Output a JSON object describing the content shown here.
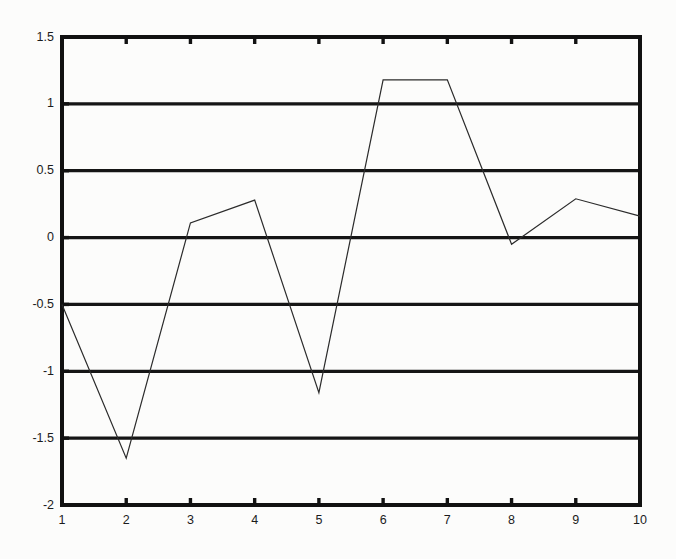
{
  "chart_data": {
    "type": "line",
    "title": "",
    "xlabel": "",
    "ylabel": "",
    "x": [
      1,
      2,
      3,
      4,
      5,
      6,
      7,
      8,
      9,
      10
    ],
    "values": [
      -0.5,
      -1.65,
      0.11,
      0.28,
      -1.16,
      1.18,
      1.18,
      -0.05,
      0.29,
      0.16
    ],
    "series": [
      {
        "name": "series-1",
        "values": [
          -0.5,
          -1.65,
          0.11,
          0.28,
          -1.16,
          1.18,
          1.18,
          -0.05,
          0.29,
          0.16
        ]
      }
    ],
    "xlim": [
      1,
      10
    ],
    "ylim": [
      -2,
      1.5
    ],
    "xticks": [
      1,
      2,
      3,
      4,
      5,
      6,
      7,
      8,
      9,
      10
    ],
    "yticks": [
      1.5,
      1,
      0.5,
      0,
      -0.5,
      -1,
      -1.5,
      -2
    ],
    "xtick_labels": [
      "1",
      "2",
      "3",
      "4",
      "5",
      "6",
      "7",
      "8",
      "9",
      "10"
    ],
    "ytick_labels": [
      "1.5",
      "1",
      "0.5",
      "0",
      "-0.5",
      "-1",
      "-1.5",
      "-2"
    ],
    "grid": true,
    "grid_axis": "y",
    "legend": null,
    "legend_position": "none",
    "line_color": "#2b2b2b",
    "grid_color": "#151515",
    "axis_color": "#111111",
    "background_color": "#fcfcfb",
    "line_width": 1.2,
    "grid_width": 3.2,
    "axis_width": 4.0
  }
}
